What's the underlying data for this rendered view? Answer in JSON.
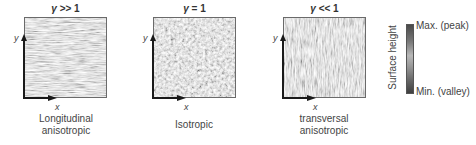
{
  "panels": [
    {
      "title_symbol": "γ",
      "title_rel": ">> 1",
      "caption_line1": "Longitudinal",
      "caption_line2": "anisotropic",
      "texture": "horizontal-streaks"
    },
    {
      "title_symbol": "γ",
      "title_rel": "= 1",
      "caption_line1": "Isotropic",
      "caption_line2": "",
      "texture": "isotropic-cells"
    },
    {
      "title_symbol": "γ",
      "title_rel": "<< 1",
      "caption_line1": "transversal",
      "caption_line2": "anisotropic",
      "texture": "vertical-streaks"
    }
  ],
  "axes": {
    "x_label": "x",
    "y_label": "y"
  },
  "colorbar": {
    "title": "Surface height",
    "max_label": "Max. (peak)",
    "min_label": "Min. (valley)",
    "colors": [
      "#4a4a4a",
      "#b8b8b8",
      "#3f3f3f"
    ]
  }
}
